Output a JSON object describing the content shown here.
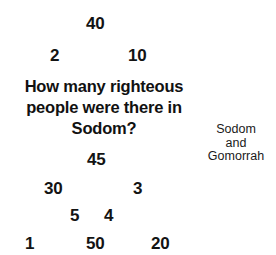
{
  "canvas": {
    "width": 276,
    "height": 255,
    "background": "#ffffff",
    "text_color": "#111111"
  },
  "question": {
    "full_text": "How many righteous people were there in Sodom?",
    "lines": [
      "How many righteous",
      "people were there in",
      "Sodom?"
    ]
  },
  "caption": {
    "full_text": "Sodom and Gomorrah",
    "lines": [
      "Sodom",
      "and",
      "Gomorrah"
    ]
  },
  "options": [
    {
      "label": "40",
      "x": 86,
      "y": 15
    },
    {
      "label": "2",
      "x": 50,
      "y": 47
    },
    {
      "label": "10",
      "x": 128,
      "y": 47
    },
    {
      "label": "45",
      "x": 87,
      "y": 151
    },
    {
      "label": "30",
      "x": 44,
      "y": 180
    },
    {
      "label": "3",
      "x": 133,
      "y": 180
    },
    {
      "label": "5",
      "x": 70,
      "y": 207
    },
    {
      "label": "4",
      "x": 104,
      "y": 207
    },
    {
      "label": "1",
      "x": 25,
      "y": 235
    },
    {
      "label": "50",
      "x": 86,
      "y": 235
    },
    {
      "label": "20",
      "x": 151,
      "y": 235
    }
  ]
}
